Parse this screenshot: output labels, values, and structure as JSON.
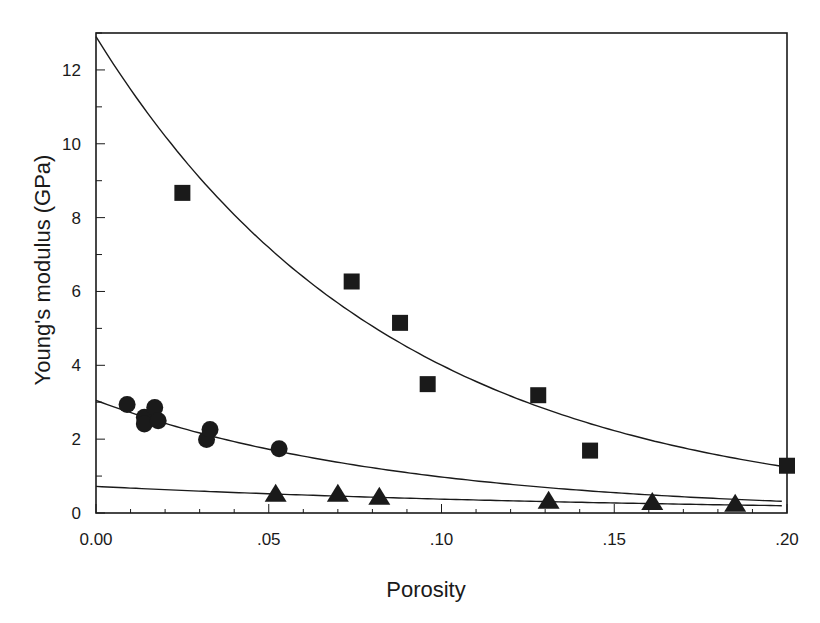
{
  "chart_data": {
    "type": "scatter",
    "title": "",
    "xlabel": "Porosity",
    "ylabel": "Young's modulus (GPa)",
    "xlim": [
      0.0,
      0.2
    ],
    "ylim": [
      0,
      13
    ],
    "x_ticks": [
      0.0,
      0.05,
      0.1,
      0.15,
      0.2
    ],
    "x_tick_labels": [
      "0.00",
      ".05",
      ".10",
      ".15",
      ".20"
    ],
    "y_ticks": [
      0,
      2,
      4,
      6,
      8,
      10,
      12
    ],
    "y_tick_labels": [
      "0",
      "2",
      "4",
      "6",
      "8",
      "10",
      "12"
    ],
    "grid": false,
    "legend": null,
    "series": [
      {
        "name": "squares",
        "marker": "square",
        "x": [
          0.025,
          0.074,
          0.088,
          0.096,
          0.128,
          0.143,
          0.2
        ],
        "y": [
          8.67,
          6.27,
          5.15,
          3.49,
          3.19,
          1.69,
          1.28
        ],
        "fit": {
          "type": "exponential",
          "E0": 12.9,
          "b": 11.7
        }
      },
      {
        "name": "circles",
        "marker": "circle",
        "x": [
          0.009,
          0.014,
          0.014,
          0.017,
          0.018,
          0.032,
          0.033,
          0.053
        ],
        "y": [
          2.94,
          2.59,
          2.41,
          2.86,
          2.5,
          1.99,
          2.26,
          1.74
        ],
        "fit": {
          "type": "exponential",
          "E0": 3.05,
          "b": 11.4
        }
      },
      {
        "name": "triangles",
        "marker": "triangle",
        "x": [
          0.052,
          0.07,
          0.082,
          0.131,
          0.161,
          0.185
        ],
        "y": [
          0.52,
          0.52,
          0.44,
          0.33,
          0.3,
          0.25
        ],
        "fit": {
          "type": "exponential",
          "E0": 0.72,
          "b": 6.5
        }
      }
    ]
  },
  "colors": {
    "ink": "#1a1a1a",
    "background": "#ffffff"
  }
}
